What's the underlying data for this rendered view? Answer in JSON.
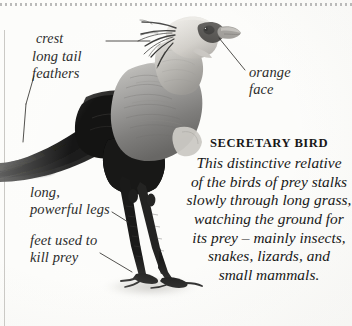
{
  "page": {
    "kind": "encyclopedia-figure",
    "background_color": "#fcfcfa",
    "rule_color": "#8c8c8c"
  },
  "figure": {
    "subject": "secretary bird",
    "style": "grayscale photograph",
    "ink_color": "#2c2c2c"
  },
  "annotations": [
    {
      "id": "crest",
      "label": "crest"
    },
    {
      "id": "tail",
      "label": "long tail\nfeathers"
    },
    {
      "id": "orange",
      "label": "orange\nface"
    },
    {
      "id": "legs",
      "label": "long,\npowerful legs"
    },
    {
      "id": "feet",
      "label": "feet used to\nkill prey"
    }
  ],
  "caption": {
    "heading": "SECRETARY BIRD",
    "lines": [
      "This distinctive relative",
      "of  the birds of prey stalks",
      "slowly through long grass,",
      "watching the ground for",
      "its prey – mainly insects,",
      "snakes, lizards, and",
      "small mammals."
    ],
    "full_text": "This distinctive relative of the birds of prey stalks slowly through long grass, watching the ground for its prey – mainly insects, snakes, lizards, and small mammals."
  }
}
